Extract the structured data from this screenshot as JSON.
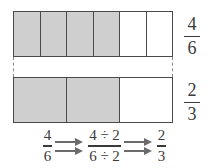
{
  "figure": {
    "colors": {
      "shaded_cell": "#cfcfcf",
      "unshaded_cell": "#ffffff",
      "bar_border": "#4a4a4a",
      "dashed_connector": "#8a8a8a",
      "text": "#3a3a3a",
      "arrow": "#6b6b6b",
      "background": "#ffffff"
    }
  },
  "bars": [
    {
      "id": "top",
      "total_cells": 6,
      "shaded_cells": 4,
      "cells": [
        "shaded",
        "shaded",
        "shaded",
        "shaded",
        "unshaded",
        "unshaded"
      ],
      "label": {
        "numerator": "4",
        "denominator": "6"
      }
    },
    {
      "id": "bottom",
      "total_cells": 3,
      "shaded_cells": 2,
      "cells": [
        "shaded",
        "shaded",
        "unshaded"
      ],
      "label": {
        "numerator": "2",
        "denominator": "3"
      }
    }
  ],
  "equation": {
    "start": {
      "numerator": "4",
      "denominator": "6"
    },
    "middle": {
      "numerator": "4 ÷ 2",
      "denominator": "6 ÷ 2"
    },
    "end": {
      "numerator": "2",
      "denominator": "3"
    },
    "arrow_glyph": "→"
  },
  "chart_data": {
    "type": "bar",
    "categories": [
      "4/6 model (6 parts)",
      "2/3 model (3 parts)"
    ],
    "series": [
      {
        "name": "total parts",
        "values": [
          6,
          3
        ]
      },
      {
        "name": "shaded parts",
        "values": [
          4,
          2
        ]
      },
      {
        "name": "fraction value",
        "values": [
          0.6667,
          0.6667
        ]
      }
    ],
    "xlabel": "",
    "ylabel": "",
    "ylim": [
      0,
      6
    ],
    "grid": false,
    "legend": "none",
    "annotations": [
      "4/6",
      "2/3",
      "4 ÷ 2",
      "6 ÷ 2"
    ]
  }
}
